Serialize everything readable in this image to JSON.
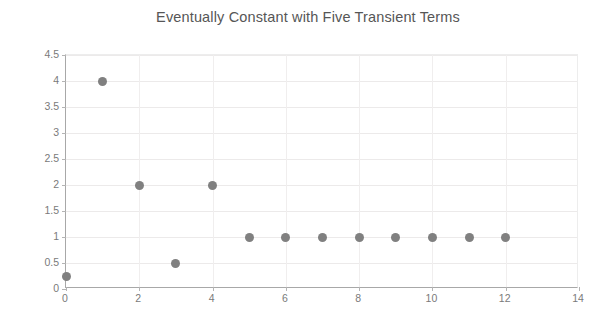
{
  "chart_data": {
    "type": "scatter",
    "title": "Eventually Constant with Five Transient Terms",
    "xlabel": "",
    "ylabel": "",
    "x": [
      0,
      1,
      2,
      3,
      4,
      5,
      6,
      7,
      8,
      9,
      10,
      11,
      12
    ],
    "values": [
      0.25,
      4,
      2,
      0.5,
      2,
      1,
      1,
      1,
      1,
      1,
      1,
      1,
      1
    ],
    "series": [
      {
        "name": "sequence",
        "points": [
          {
            "x": 0,
            "y": 0.25
          },
          {
            "x": 1,
            "y": 4
          },
          {
            "x": 2,
            "y": 2
          },
          {
            "x": 3,
            "y": 0.5
          },
          {
            "x": 4,
            "y": 2
          },
          {
            "x": 5,
            "y": 1
          },
          {
            "x": 6,
            "y": 1
          },
          {
            "x": 7,
            "y": 1
          },
          {
            "x": 8,
            "y": 1
          },
          {
            "x": 9,
            "y": 1
          },
          {
            "x": 10,
            "y": 1
          },
          {
            "x": 11,
            "y": 1
          },
          {
            "x": 12,
            "y": 1
          }
        ],
        "marker_color": "#808080"
      }
    ],
    "xlim": [
      0,
      14
    ],
    "ylim": [
      0,
      4.5
    ],
    "xticks": [
      0,
      2,
      4,
      6,
      8,
      10,
      12,
      14
    ],
    "xtick_labels": [
      "0",
      "2",
      "4",
      "6",
      "8",
      "10",
      "12",
      "14"
    ],
    "yticks": [
      0,
      0.5,
      1,
      1.5,
      2,
      2.5,
      3,
      3.5,
      4,
      4.5
    ],
    "ytick_labels": [
      "0",
      "0.5",
      "1",
      "1.5",
      "2",
      "2.5",
      "3",
      "3.5",
      "4",
      "4.5"
    ],
    "gridlines_horizontal": [
      0.5,
      1,
      1.5,
      2,
      2.5,
      3,
      3.5,
      4,
      4.5
    ],
    "gridlines_vertical": [
      2,
      4,
      6,
      8,
      10,
      12
    ],
    "grid": true,
    "legend": false,
    "legend_position": "none",
    "background_color": "#ffffff",
    "grid_color": "#eceaea",
    "axis_color": "#a8a8a8",
    "tick_label_color": "#7a7a7a",
    "title_color": "#565656"
  }
}
